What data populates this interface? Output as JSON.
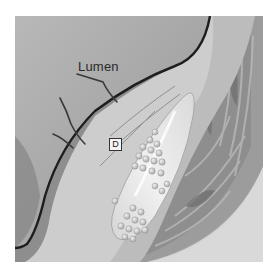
{
  "figure": {
    "labels": {
      "lumen": "Lumen",
      "marker": "D"
    },
    "colors": {
      "background": "#ffffff",
      "lumen": "#a9a9a9",
      "boundary_line": "#1e1e1e",
      "intima": "#cfcfcf",
      "plaque_core": "#e6e6e6",
      "media": "#8a8a8a",
      "adventitia": "#9b9b9b",
      "outer_corner": "#d8d8d8"
    }
  }
}
